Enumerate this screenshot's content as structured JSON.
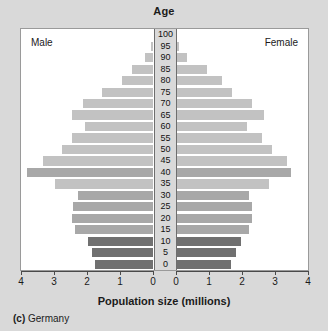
{
  "title": "Age",
  "male_label": "Male",
  "female_label": "Female",
  "x_axis_title": "Population size (millions)",
  "caption": {
    "index": "(c)",
    "text": "Germany"
  },
  "colors": {
    "page_background": "#d9d9d9",
    "plot_background": "#ffffff",
    "bar_light": "#c2c2c2",
    "bar_mid": "#a8a8a8",
    "bar_dark": "#707070",
    "axis": "#4a4a4a",
    "text": "#1b1b1b"
  },
  "chart_data": {
    "type": "bar",
    "subtype": "population-pyramid",
    "title": "Age",
    "xlabel": "Population size (millions)",
    "ylabel": "Age",
    "xlim": [
      0,
      4
    ],
    "xticks": [
      0,
      1,
      2,
      3,
      4
    ],
    "left_tick_labels": [
      "4",
      "3",
      "2",
      "1",
      "0"
    ],
    "right_tick_labels": [
      "0",
      "1",
      "2",
      "3",
      "4"
    ],
    "grid": false,
    "legend": false,
    "categories": [
      "100",
      "95",
      "90",
      "85",
      "80",
      "75",
      "70",
      "65",
      "60",
      "55",
      "50",
      "45",
      "40",
      "35",
      "30",
      "25",
      "20",
      "15",
      "10",
      "5",
      "0"
    ],
    "series": [
      {
        "name": "Male",
        "side": "left",
        "values": [
          0.0,
          0.05,
          0.25,
          0.62,
          0.95,
          1.55,
          2.1,
          2.45,
          2.05,
          2.45,
          2.75,
          3.3,
          3.8,
          2.95,
          2.25,
          2.4,
          2.45,
          2.35,
          1.95,
          1.85,
          1.75
        ]
      },
      {
        "name": "Female",
        "side": "right",
        "values": [
          0.0,
          0.08,
          0.32,
          0.92,
          1.4,
          1.7,
          2.3,
          2.65,
          2.15,
          2.6,
          2.9,
          3.35,
          3.45,
          2.8,
          2.2,
          2.3,
          2.3,
          2.2,
          1.95,
          1.8,
          1.65
        ]
      }
    ],
    "bar_shades": [
      "light",
      "light",
      "light",
      "light",
      "light",
      "light",
      "light",
      "light",
      "light",
      "light",
      "light",
      "light",
      "mid",
      "light",
      "mid",
      "mid",
      "mid",
      "mid",
      "dark",
      "dark",
      "dark"
    ]
  }
}
